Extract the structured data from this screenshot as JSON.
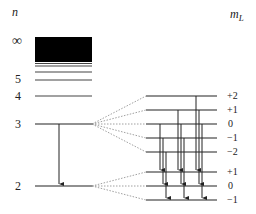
{
  "labels": {
    "n_header": "n",
    "ml_header_main": "m",
    "ml_header_sub": "L",
    "n_infinity": "∞",
    "n5": "5",
    "n4": "4",
    "n3": "3",
    "n2": "2"
  },
  "ml_upper": [
    "+2",
    "+1",
    "0",
    "−1",
    "−2"
  ],
  "ml_lower": [
    "+1",
    "0",
    "−1"
  ],
  "colors": {
    "line": "#222222",
    "dotted": "#888888",
    "continuum": "#000000"
  },
  "levels": {
    "left_x": [
      35,
      92
    ],
    "right_x": [
      146,
      217
    ],
    "n_y": {
      "inf_top": 37,
      "inf_bottom": 62,
      "extra": [
        64,
        66,
        72
      ],
      "5": 80,
      "4": 96,
      "3": 124,
      "2": 186
    },
    "upper_y": [
      96,
      110,
      124,
      138,
      152
    ],
    "lower_y": [
      172,
      186,
      200
    ]
  },
  "transitions": [
    {
      "x": 160,
      "from": "0",
      "to": "+1"
    },
    {
      "x": 163,
      "from": "-1",
      "to": "0"
    },
    {
      "x": 166,
      "from": "-2",
      "to": "-1"
    },
    {
      "x": 178,
      "from": "+1",
      "to": "+1"
    },
    {
      "x": 181,
      "from": "0",
      "to": "0"
    },
    {
      "x": 184,
      "from": "-1",
      "to": "-1"
    },
    {
      "x": 196,
      "from": "+2",
      "to": "+1"
    },
    {
      "x": 199,
      "from": "+1",
      "to": "0"
    },
    {
      "x": 202,
      "from": "0",
      "to": "-1"
    }
  ]
}
